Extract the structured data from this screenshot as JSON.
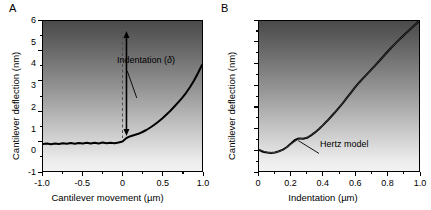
{
  "figure": {
    "panels": [
      {
        "label": "A",
        "xlabel": "Cantilever movement  (µm)",
        "ylabel": "Cantilever deflection (nm)",
        "xticks": [
          "-1.0",
          "-0.5",
          "0",
          "0.5",
          "1.0"
        ],
        "yticks": [
          "12",
          "9",
          "6",
          "3",
          "0",
          "-3"
        ],
        "annotation_text": "Indentation (",
        "annotation_symbol": "δ",
        "annotation_close": ")"
      },
      {
        "label": "B",
        "xlabel": "Indentation  (µm)",
        "ylabel": "Cantilever deflection (nm)",
        "xticks": [
          "0",
          "0.2",
          "0.4",
          "0.6",
          "0.8",
          "1.0"
        ],
        "yticks": [
          "6",
          "5",
          "4",
          "3",
          "2",
          "1",
          "0",
          "-1"
        ],
        "annotation_text": "Hertz model"
      }
    ]
  },
  "chart_data": [
    {
      "type": "line",
      "title": "A",
      "xlabel": "Cantilever movement  (µm)",
      "ylabel": "Cantilever deflection (nm)",
      "xlim": [
        -1.0,
        1.0
      ],
      "ylim": [
        -3,
        12
      ],
      "xticks": [
        -1.0,
        -0.5,
        0,
        0.5,
        1.0
      ],
      "yticks": [
        12,
        9,
        6,
        3,
        0,
        -3
      ],
      "grid": false,
      "legend": "none",
      "annotations": [
        {
          "text": "Indentation (δ)",
          "x": 0.12,
          "y": 8.4,
          "arrow": "double-headed vertical arrow at x=0.05 from y=0.5 to y=11.0",
          "dashed_line": "vertical dashed line at x=0.0 from y=0.3 to y=11.0",
          "leader_from": [
            0.06,
            7.0
          ],
          "leader_to": [
            0.18,
            4.3
          ]
        }
      ],
      "series": [
        {
          "name": "force-distance curve",
          "x": [
            -1.0,
            -0.95,
            -0.9,
            -0.85,
            -0.8,
            -0.75,
            -0.7,
            -0.65,
            -0.6,
            -0.55,
            -0.5,
            -0.45,
            -0.4,
            -0.35,
            -0.3,
            -0.25,
            -0.2,
            -0.15,
            -0.1,
            -0.05,
            0.0,
            0.05,
            0.1,
            0.15,
            0.2,
            0.25,
            0.3,
            0.35,
            0.4,
            0.45,
            0.5,
            0.55,
            0.6,
            0.65,
            0.7,
            0.75,
            0.8,
            0.85,
            0.9,
            0.95,
            1.0
          ],
          "y": [
            -0.3,
            -0.26,
            -0.32,
            -0.24,
            -0.3,
            -0.22,
            -0.28,
            -0.2,
            -0.27,
            -0.19,
            -0.25,
            -0.18,
            -0.26,
            -0.17,
            -0.24,
            -0.16,
            -0.22,
            -0.18,
            -0.22,
            -0.15,
            -0.05,
            0.3,
            0.48,
            0.6,
            0.72,
            0.9,
            1.1,
            1.35,
            1.62,
            1.92,
            2.25,
            2.62,
            3.0,
            3.42,
            3.86,
            4.32,
            4.82,
            5.4,
            6.05,
            6.8,
            7.6
          ]
        }
      ]
    },
    {
      "type": "line",
      "title": "B",
      "xlabel": "Indentation  (µm)",
      "ylabel": "Cantilever deflection (nm)",
      "xlim": [
        0.0,
        1.0
      ],
      "ylim": [
        -1,
        6
      ],
      "xticks": [
        0,
        0.2,
        0.4,
        0.6,
        0.8,
        1.0
      ],
      "yticks": [
        6,
        5,
        4,
        3,
        2,
        1,
        0,
        -1
      ],
      "grid": false,
      "legend": "none",
      "annotations": [
        {
          "text": "Hertz model",
          "x": 0.4,
          "y": -0.3,
          "leader_from": [
            0.375,
            -0.18
          ],
          "leader_to": [
            0.245,
            0.42
          ]
        }
      ],
      "series": [
        {
          "name": "indentation curve",
          "x": [
            0.0,
            0.025,
            0.05,
            0.075,
            0.1,
            0.125,
            0.15,
            0.175,
            0.2,
            0.225,
            0.25,
            0.275,
            0.3,
            0.325,
            0.35,
            0.375,
            0.4,
            0.425,
            0.45,
            0.475,
            0.5,
            0.525,
            0.55,
            0.575,
            0.6,
            0.625,
            0.65,
            0.675,
            0.7,
            0.725,
            0.75,
            0.775,
            0.8,
            0.825,
            0.85,
            0.875,
            0.9,
            0.925,
            0.95,
            0.975,
            1.0
          ],
          "y": [
            -0.02,
            -0.1,
            -0.14,
            -0.16,
            -0.14,
            -0.08,
            0.0,
            0.12,
            0.28,
            0.45,
            0.52,
            0.5,
            0.55,
            0.66,
            0.8,
            0.96,
            1.14,
            1.33,
            1.53,
            1.74,
            1.96,
            2.18,
            2.42,
            2.66,
            2.9,
            3.12,
            3.32,
            3.52,
            3.72,
            3.92,
            4.12,
            4.33,
            4.54,
            4.74,
            4.93,
            5.12,
            5.3,
            5.48,
            5.65,
            5.82,
            6.0
          ]
        },
        {
          "name": "Hertz model fit",
          "x": [
            0.0,
            0.05,
            0.1,
            0.15,
            0.2,
            0.25,
            0.3,
            0.35,
            0.4,
            0.45,
            0.5,
            0.55,
            0.6,
            0.65,
            0.7,
            0.75,
            0.8,
            0.85,
            0.9,
            0.95,
            1.0
          ],
          "y": [
            0.0,
            -0.13,
            -0.14,
            -0.02,
            0.26,
            0.5,
            0.56,
            0.8,
            1.14,
            1.53,
            1.96,
            2.42,
            2.9,
            3.32,
            3.72,
            4.12,
            4.54,
            4.93,
            5.3,
            5.65,
            6.0
          ]
        }
      ]
    }
  ]
}
